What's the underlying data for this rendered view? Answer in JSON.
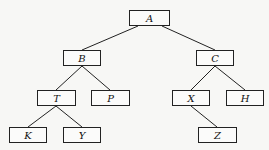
{
  "diagram": {
    "type": "binary-tree",
    "nodes": {
      "A": {
        "label": "A",
        "x": 129,
        "y": 10,
        "w": 41,
        "h": 16
      },
      "B": {
        "label": "B",
        "x": 63,
        "y": 50,
        "w": 38,
        "h": 16
      },
      "C": {
        "label": "C",
        "x": 196,
        "y": 50,
        "w": 38,
        "h": 16
      },
      "T": {
        "label": "T",
        "x": 37,
        "y": 90,
        "w": 39,
        "h": 16
      },
      "P": {
        "label": "P",
        "x": 91,
        "y": 90,
        "w": 39,
        "h": 16
      },
      "X": {
        "label": "X",
        "x": 172,
        "y": 90,
        "w": 38,
        "h": 16
      },
      "H": {
        "label": "H",
        "x": 226,
        "y": 90,
        "w": 38,
        "h": 16
      },
      "K": {
        "label": "K",
        "x": 9,
        "y": 127,
        "w": 38,
        "h": 16
      },
      "Y": {
        "label": "Y",
        "x": 63,
        "y": 127,
        "w": 38,
        "h": 16
      },
      "Z": {
        "label": "Z",
        "x": 198,
        "y": 127,
        "w": 39,
        "h": 16
      }
    },
    "edges": [
      [
        "A",
        "B"
      ],
      [
        "A",
        "C"
      ],
      [
        "B",
        "T"
      ],
      [
        "B",
        "P"
      ],
      [
        "C",
        "X"
      ],
      [
        "C",
        "H"
      ],
      [
        "T",
        "K"
      ],
      [
        "T",
        "Y"
      ],
      [
        "X",
        "Z"
      ]
    ]
  }
}
